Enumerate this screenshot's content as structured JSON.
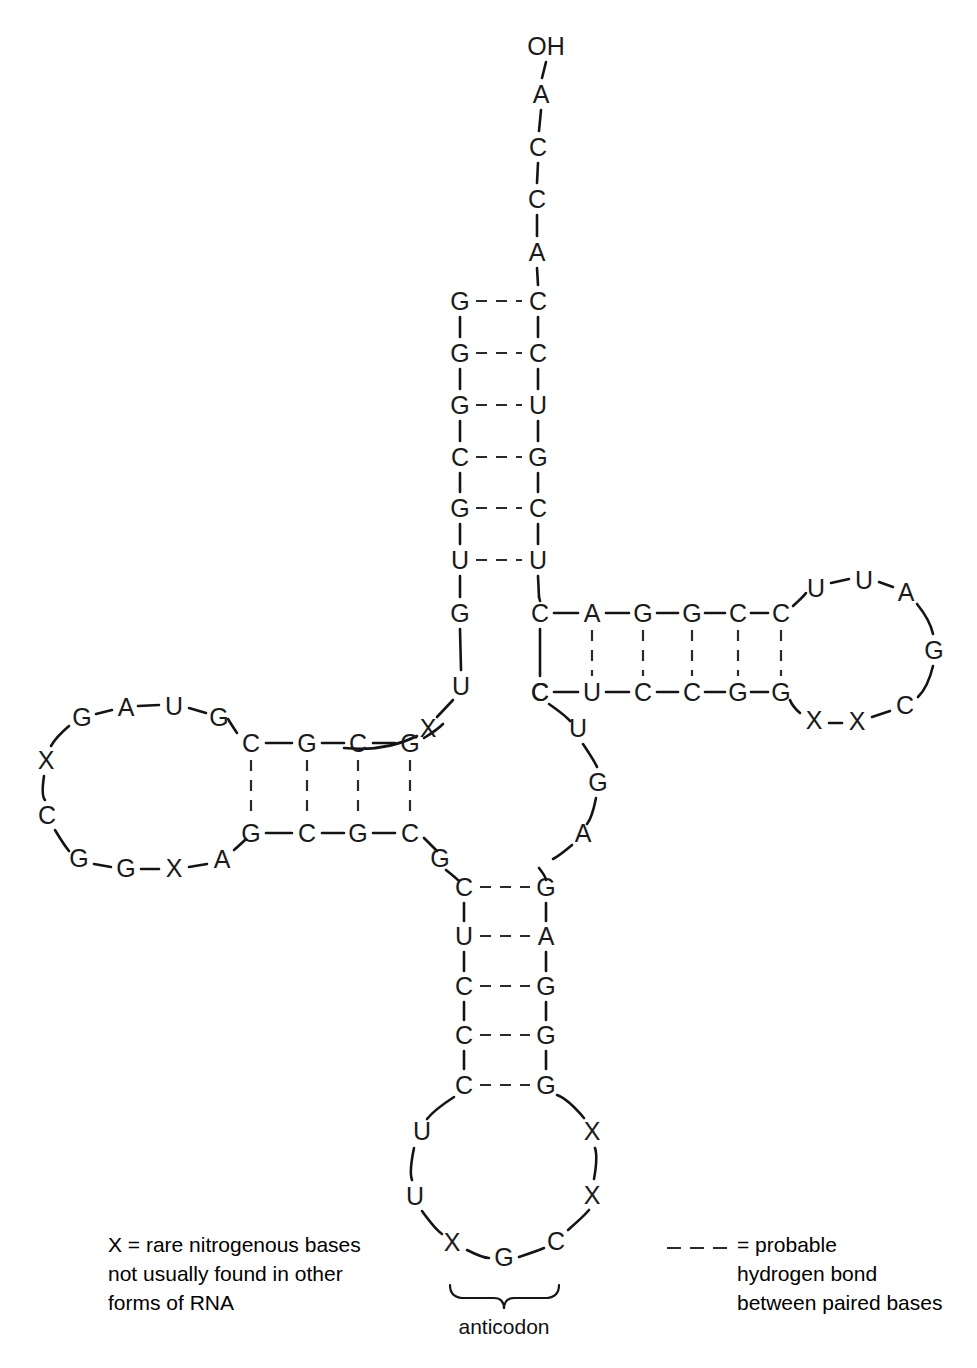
{
  "figure": {
    "terminus_label": "OH",
    "anticodon_label": "anticodon",
    "ink_color": "#141414",
    "background_color": "#ffffff"
  },
  "legend": {
    "rare_bases": {
      "symbol": "X",
      "equals": "=",
      "line1": "X  =  rare nitrogenous bases",
      "line2": "not usually found in other",
      "line3": "forms of RNA"
    },
    "hydrogen_bond": {
      "dash_sample": "— — —",
      "equals": "=",
      "line1": "=  probable",
      "line2": "hydrogen bond",
      "line3": "between paired bases"
    }
  },
  "chart_data": {
    "type": "diagram",
    "bases": [
      {
        "id": "acc3-OH",
        "label": "OH",
        "x": 546,
        "y": 46,
        "region": "acceptor-3prime-terminus"
      },
      {
        "id": "acc3-1",
        "label": "A",
        "x": 541,
        "y": 94,
        "region": "acceptor-3prime-tail"
      },
      {
        "id": "acc3-2",
        "label": "C",
        "x": 538,
        "y": 147,
        "region": "acceptor-3prime-tail"
      },
      {
        "id": "acc3-3",
        "label": "C",
        "x": 537,
        "y": 199,
        "region": "acceptor-3prime-tail"
      },
      {
        "id": "acc3-4",
        "label": "A",
        "x": 537,
        "y": 252,
        "region": "acceptor-3prime-tail"
      },
      {
        "id": "accL-1",
        "label": "G",
        "x": 460,
        "y": 301,
        "region": "acceptor-stem-5prime"
      },
      {
        "id": "accL-2",
        "label": "G",
        "x": 460,
        "y": 353,
        "region": "acceptor-stem-5prime"
      },
      {
        "id": "accL-3",
        "label": "G",
        "x": 460,
        "y": 405,
        "region": "acceptor-stem-5prime"
      },
      {
        "id": "accL-4",
        "label": "C",
        "x": 460,
        "y": 457,
        "region": "acceptor-stem-5prime"
      },
      {
        "id": "accL-5",
        "label": "G",
        "x": 460,
        "y": 508,
        "region": "acceptor-stem-5prime"
      },
      {
        "id": "accL-6",
        "label": "U",
        "x": 460,
        "y": 560,
        "region": "acceptor-stem-5prime"
      },
      {
        "id": "accR-1",
        "label": "C",
        "x": 538,
        "y": 301,
        "region": "acceptor-stem-3prime"
      },
      {
        "id": "accR-2",
        "label": "C",
        "x": 538,
        "y": 353,
        "region": "acceptor-stem-3prime"
      },
      {
        "id": "accR-3",
        "label": "U",
        "x": 538,
        "y": 405,
        "region": "acceptor-stem-3prime"
      },
      {
        "id": "accR-4",
        "label": "G",
        "x": 538,
        "y": 457,
        "region": "acceptor-stem-3prime"
      },
      {
        "id": "accR-5",
        "label": "C",
        "x": 538,
        "y": 508,
        "region": "acceptor-stem-3prime"
      },
      {
        "id": "accR-6",
        "label": "U",
        "x": 538,
        "y": 560,
        "region": "acceptor-stem-3prime"
      },
      {
        "id": "link5-G",
        "label": "G",
        "x": 460,
        "y": 613,
        "region": "5prime-linker"
      },
      {
        "id": "link5-U",
        "label": "U",
        "x": 461,
        "y": 686,
        "region": "5prime-linker"
      },
      {
        "id": "link5-X",
        "label": "X",
        "x": 428,
        "y": 728,
        "region": "5prime-linker"
      },
      {
        "id": "dloop-G1",
        "label": "G",
        "x": 82,
        "y": 717,
        "region": "d-loop"
      },
      {
        "id": "dloop-A",
        "label": "A",
        "x": 126,
        "y": 707,
        "region": "d-loop"
      },
      {
        "id": "dloop-U",
        "label": "U",
        "x": 174,
        "y": 706,
        "region": "d-loop"
      },
      {
        "id": "dloop-G2",
        "label": "G",
        "x": 219,
        "y": 717,
        "region": "d-loop"
      },
      {
        "id": "dloop-X1",
        "label": "X",
        "x": 46,
        "y": 760,
        "region": "d-loop"
      },
      {
        "id": "dloop-C",
        "label": "C",
        "x": 47,
        "y": 815,
        "region": "d-loop"
      },
      {
        "id": "dloop-G3",
        "label": "G",
        "x": 79,
        "y": 858,
        "region": "d-loop"
      },
      {
        "id": "dloop-G4",
        "label": "G",
        "x": 126,
        "y": 868,
        "region": "d-loop"
      },
      {
        "id": "dloop-X2",
        "label": "X",
        "x": 174,
        "y": 868,
        "region": "d-loop"
      },
      {
        "id": "dloop-A2",
        "label": "A",
        "x": 222,
        "y": 859,
        "region": "d-loop"
      },
      {
        "id": "dstemT-1",
        "label": "C",
        "x": 251,
        "y": 743,
        "region": "d-stem-top"
      },
      {
        "id": "dstemT-2",
        "label": "G",
        "x": 307,
        "y": 743,
        "region": "d-stem-top"
      },
      {
        "id": "dstemT-3",
        "label": "C",
        "x": 358,
        "y": 743,
        "region": "d-stem-top"
      },
      {
        "id": "dstemT-4",
        "label": "G",
        "x": 410,
        "y": 743,
        "region": "d-stem-top"
      },
      {
        "id": "dstemB-1",
        "label": "G",
        "x": 251,
        "y": 833,
        "region": "d-stem-bottom"
      },
      {
        "id": "dstemB-2",
        "label": "C",
        "x": 307,
        "y": 833,
        "region": "d-stem-bottom"
      },
      {
        "id": "dstemB-3",
        "label": "G",
        "x": 358,
        "y": 833,
        "region": "d-stem-bottom"
      },
      {
        "id": "dstemB-4",
        "label": "C",
        "x": 410,
        "y": 833,
        "region": "d-stem-bottom"
      },
      {
        "id": "junc-G",
        "label": "G",
        "x": 440,
        "y": 858,
        "region": "core-junction"
      },
      {
        "id": "acL-1",
        "label": "C",
        "x": 464,
        "y": 887,
        "region": "anticodon-stem-left"
      },
      {
        "id": "acL-2",
        "label": "U",
        "x": 464,
        "y": 936,
        "region": "anticodon-stem-left"
      },
      {
        "id": "acL-3",
        "label": "C",
        "x": 464,
        "y": 986,
        "region": "anticodon-stem-left"
      },
      {
        "id": "acL-4",
        "label": "C",
        "x": 464,
        "y": 1035,
        "region": "anticodon-stem-left"
      },
      {
        "id": "acL-5",
        "label": "C",
        "x": 464,
        "y": 1085,
        "region": "anticodon-stem-left"
      },
      {
        "id": "acR-1",
        "label": "G",
        "x": 546,
        "y": 887,
        "region": "anticodon-stem-right"
      },
      {
        "id": "acR-2",
        "label": "A",
        "x": 546,
        "y": 936,
        "region": "anticodon-stem-right"
      },
      {
        "id": "acR-3",
        "label": "G",
        "x": 546,
        "y": 986,
        "region": "anticodon-stem-right"
      },
      {
        "id": "acR-4",
        "label": "G",
        "x": 546,
        "y": 1035,
        "region": "anticodon-stem-right"
      },
      {
        "id": "acR-5",
        "label": "G",
        "x": 546,
        "y": 1085,
        "region": "anticodon-stem-right"
      },
      {
        "id": "acloop-U1",
        "label": "U",
        "x": 422,
        "y": 1131,
        "region": "anticodon-loop"
      },
      {
        "id": "acloop-U2",
        "label": "U",
        "x": 415,
        "y": 1196,
        "region": "anticodon-loop"
      },
      {
        "id": "acloop-X1",
        "label": "X",
        "x": 452,
        "y": 1242,
        "region": "anticodon-loop"
      },
      {
        "id": "acloop-G",
        "label": "G",
        "x": 504,
        "y": 1257,
        "region": "anticodon-loop"
      },
      {
        "id": "acloop-C",
        "label": "C",
        "x": 556,
        "y": 1241,
        "region": "anticodon-loop"
      },
      {
        "id": "acloop-X2",
        "label": "X",
        "x": 592,
        "y": 1195,
        "region": "anticodon-loop"
      },
      {
        "id": "acloop-X3",
        "label": "X",
        "x": 592,
        "y": 1131,
        "region": "anticodon-loop"
      },
      {
        "id": "var-G",
        "label": "G",
        "x": 598,
        "y": 782,
        "region": "variable-loop"
      },
      {
        "id": "var-A",
        "label": "A",
        "x": 583,
        "y": 833,
        "region": "variable-loop"
      },
      {
        "id": "var-U",
        "label": "U",
        "x": 578,
        "y": 728,
        "region": "variable-loop"
      },
      {
        "id": "var-C",
        "label": "C",
        "x": 540,
        "y": 692,
        "region": "variable-loop"
      },
      {
        "id": "tstemT-1",
        "label": "C",
        "x": 540,
        "y": 613,
        "region": "t-stem-top"
      },
      {
        "id": "tstemT-2",
        "label": "A",
        "x": 592,
        "y": 613,
        "region": "t-stem-top"
      },
      {
        "id": "tstemT-3",
        "label": "G",
        "x": 643,
        "y": 613,
        "region": "t-stem-top"
      },
      {
        "id": "tstemT-4",
        "label": "G",
        "x": 692,
        "y": 613,
        "region": "t-stem-top"
      },
      {
        "id": "tstemT-5",
        "label": "C",
        "x": 738,
        "y": 613,
        "region": "t-stem-top"
      },
      {
        "id": "tstemT-6",
        "label": "C",
        "x": 781,
        "y": 613,
        "region": "t-stem-top"
      },
      {
        "id": "tstemB-1",
        "label": "C",
        "x": 540,
        "y": 692,
        "region": "t-stem-bottom"
      },
      {
        "id": "tstemB-2",
        "label": "U",
        "x": 592,
        "y": 692,
        "region": "t-stem-bottom"
      },
      {
        "id": "tstemB-3",
        "label": "C",
        "x": 643,
        "y": 692,
        "region": "t-stem-bottom"
      },
      {
        "id": "tstemB-4",
        "label": "C",
        "x": 692,
        "y": 692,
        "region": "t-stem-bottom"
      },
      {
        "id": "tstemB-5",
        "label": "G",
        "x": 738,
        "y": 692,
        "region": "t-stem-bottom"
      },
      {
        "id": "tstemB-6",
        "label": "G",
        "x": 781,
        "y": 692,
        "region": "t-stem-bottom"
      },
      {
        "id": "tloop-U1",
        "label": "U",
        "x": 816,
        "y": 588,
        "region": "t-loop"
      },
      {
        "id": "tloop-U2",
        "label": "U",
        "x": 864,
        "y": 580,
        "region": "t-loop"
      },
      {
        "id": "tloop-A",
        "label": "A",
        "x": 906,
        "y": 592,
        "region": "t-loop"
      },
      {
        "id": "tloop-G",
        "label": "G",
        "x": 934,
        "y": 650,
        "region": "t-loop"
      },
      {
        "id": "tloop-C",
        "label": "C",
        "x": 905,
        "y": 705,
        "region": "t-loop"
      },
      {
        "id": "tloop-X1",
        "label": "X",
        "x": 857,
        "y": 721,
        "region": "t-loop"
      },
      {
        "id": "tloop-X2",
        "label": "X",
        "x": 814,
        "y": 720,
        "region": "t-loop"
      }
    ],
    "base_pairs": [
      {
        "left": "accL-1",
        "right": "accR-1",
        "pair": "G-C"
      },
      {
        "left": "accL-2",
        "right": "accR-2",
        "pair": "G-C"
      },
      {
        "left": "accL-3",
        "right": "accR-3",
        "pair": "G-U"
      },
      {
        "left": "accL-4",
        "right": "accR-4",
        "pair": "C-G"
      },
      {
        "left": "accL-5",
        "right": "accR-5",
        "pair": "G-C"
      },
      {
        "left": "accL-6",
        "right": "accR-6",
        "pair": "U-U"
      },
      {
        "left": "dstemT-1",
        "right": "dstemB-1",
        "pair": "C-G"
      },
      {
        "left": "dstemT-2",
        "right": "dstemB-2",
        "pair": "G-C"
      },
      {
        "left": "dstemT-3",
        "right": "dstemB-3",
        "pair": "C-G"
      },
      {
        "left": "dstemT-4",
        "right": "dstemB-4",
        "pair": "G-C"
      },
      {
        "left": "acL-1",
        "right": "acR-1",
        "pair": "C-G"
      },
      {
        "left": "acL-2",
        "right": "acR-2",
        "pair": "U-A"
      },
      {
        "left": "acL-3",
        "right": "acR-3",
        "pair": "C-G"
      },
      {
        "left": "acL-4",
        "right": "acR-4",
        "pair": "C-G"
      },
      {
        "left": "acL-5",
        "right": "acR-5",
        "pair": "C-G"
      },
      {
        "left": "tstemT-2",
        "right": "tstemB-2",
        "pair": "A-U"
      },
      {
        "left": "tstemT-3",
        "right": "tstemB-3",
        "pair": "G-C"
      },
      {
        "left": "tstemT-4",
        "right": "tstemB-4",
        "pair": "G-C"
      },
      {
        "left": "tstemT-5",
        "right": "tstemB-5",
        "pair": "C-G"
      },
      {
        "left": "tstemT-6",
        "right": "tstemB-6",
        "pair": "C-G"
      }
    ],
    "anticodon_triplet": [
      "X",
      "G",
      "C"
    ],
    "acceptor_3prime_end": [
      "A",
      "C",
      "C",
      "A"
    ],
    "regions": [
      "acceptor stem",
      "D-arm",
      "anticodon arm",
      "variable loop",
      "T-arm"
    ]
  }
}
